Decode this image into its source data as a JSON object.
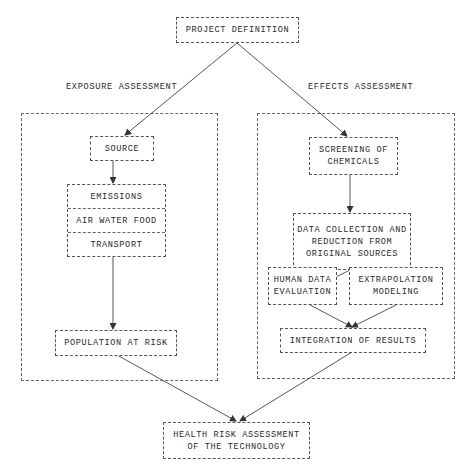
{
  "diagram": {
    "type": "flowchart",
    "top": {
      "project_definition": "PROJECT DEFINITION"
    },
    "exposure": {
      "title": "EXPOSURE ASSESSMENT",
      "source": "SOURCE",
      "pathway_rows": [
        "EMISSIONS",
        "AIR WATER FOOD",
        "TRANSPORT"
      ],
      "population": "POPULATION AT RISK"
    },
    "effects": {
      "title": "EFFECTS ASSESSMENT",
      "screening": "SCREENING OF\nCHEMICALS",
      "data_collection": "DATA COLLECTION AND\nREDUCTION FROM\nORIGINAL SOURCES",
      "human_data": "HUMAN DATA\nEVALUATION",
      "extrapolation": "EXTRAPOLATION\nMODELING",
      "integration": "INTEGRATION OF RESULTS"
    },
    "bottom": {
      "health_risk": "HEALTH RISK ASSESSMENT\nOF THE TECHNOLOGY"
    },
    "edges": [
      [
        "PROJECT DEFINITION",
        "SOURCE"
      ],
      [
        "PROJECT DEFINITION",
        "SCREENING OF CHEMICALS"
      ],
      [
        "SOURCE",
        "EMISSIONS"
      ],
      [
        "TRANSPORT",
        "POPULATION AT RISK"
      ],
      [
        "SCREENING OF CHEMICALS",
        "DATA COLLECTION AND REDUCTION FROM ORIGINAL SOURCES"
      ],
      [
        "DATA COLLECTION AND REDUCTION FROM ORIGINAL SOURCES",
        "HUMAN DATA EVALUATION"
      ],
      [
        "DATA COLLECTION AND REDUCTION FROM ORIGINAL SOURCES",
        "EXTRAPOLATION MODELING"
      ],
      [
        "HUMAN DATA EVALUATION",
        "INTEGRATION OF RESULTS"
      ],
      [
        "EXTRAPOLATION MODELING",
        "INTEGRATION OF RESULTS"
      ],
      [
        "POPULATION AT RISK",
        "HEALTH RISK ASSESSMENT OF THE TECHNOLOGY"
      ],
      [
        "INTEGRATION OF RESULTS",
        "HEALTH RISK ASSESSMENT OF THE TECHNOLOGY"
      ]
    ]
  }
}
